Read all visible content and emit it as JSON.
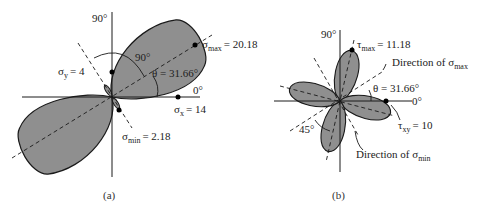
{
  "figure_a": {
    "caption": "(a)",
    "axis_90_label": "90°",
    "axis_0_label": "0°",
    "angle_90_label": "90°",
    "theta_label": "θ = 31.66°",
    "sigma_max": {
      "symbol": "σ",
      "sub": "max",
      "value": "= 20.18"
    },
    "sigma_x": {
      "symbol": "σ",
      "sub": "x",
      "value": "= 14"
    },
    "sigma_y": {
      "symbol": "σ",
      "sub": "y",
      "value": "= 4"
    },
    "sigma_min": {
      "symbol": "σ",
      "sub": "min",
      "value": "= 2.18"
    }
  },
  "figure_b": {
    "caption": "(b)",
    "axis_90_label": "90°",
    "axis_0_label": "0°",
    "angle_45_label": "45°",
    "theta_label": "θ = 31.66°",
    "tau_max": {
      "symbol": "τ",
      "sub": "max",
      "value": "= 11.18"
    },
    "tau_xy": {
      "symbol": "τ",
      "sub": "xy",
      "value": "= 10"
    },
    "dir_sigma_max": {
      "prefix": "Direction of σ",
      "sub": "max"
    },
    "dir_sigma_min": {
      "prefix": "Direction of σ",
      "sub": "min"
    }
  },
  "colors": {
    "lobe_fill": "#8f8f8f",
    "stroke": "#1a1a1a"
  }
}
